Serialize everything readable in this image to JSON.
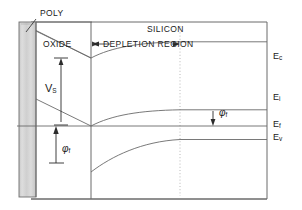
{
  "figure": {
    "regions": {
      "poly": "POLY",
      "oxide": "OXIDE",
      "silicon": "SILICON",
      "depletion": "DEPLETION REGION"
    },
    "energy_levels": [
      {
        "id": "Ec",
        "symbol": "E",
        "subscript": "c",
        "label": "Ec",
        "y": 58
      },
      {
        "id": "Ei",
        "symbol": "E",
        "subscript": "i",
        "label": "Ei",
        "y": 99
      },
      {
        "id": "Ef",
        "symbol": "E",
        "subscript": "f",
        "label": "Ef",
        "y": 126
      },
      {
        "id": "Ev",
        "symbol": "E",
        "subscript": "v",
        "label": "Ev",
        "y": 139
      }
    ],
    "annotations": [
      {
        "id": "vs",
        "symbol": "V",
        "subscript": "S",
        "label": "VS",
        "kind": "double-arrow-vertical"
      },
      {
        "id": "phi-f-left",
        "symbol": "φ",
        "subscript": "f",
        "label": "φf",
        "kind": "arrow-up"
      },
      {
        "id": "phi-f-mid",
        "symbol": "φ",
        "subscript": "f",
        "label": "φf",
        "kind": "arrow-down"
      }
    ],
    "colors": {
      "line": "#555555",
      "frame": "#4d4d4d",
      "text": "#1a1a1a",
      "poly_fill": "#d2d2d2",
      "dotted": "#aaaaaa",
      "background": "#ffffff"
    }
  }
}
